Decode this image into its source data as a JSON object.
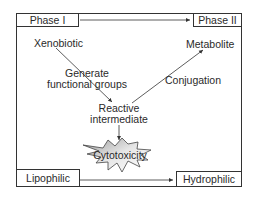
{
  "diagram": {
    "type": "metabolism-pathway",
    "corner_labels": {
      "top_left": "Phase I",
      "top_right": "Phase II",
      "bottom_left": "Lipophilic",
      "bottom_right": "Hydrophilic"
    },
    "nodes": {
      "xenobiotic": "Xenobiotic",
      "metabolite": "Metabolite",
      "reactive_line1": "Reactive",
      "reactive_line2": "intermediate",
      "cytotoxicity": "Cytotoxicity"
    },
    "edge_labels": {
      "generate_line1": "Generate",
      "generate_line2": "functional groups",
      "conjugation": "Conjugation"
    },
    "edges": [
      {
        "from": "Phase I",
        "to": "Phase II"
      },
      {
        "from": "Lipophilic",
        "to": "Hydrophilic"
      },
      {
        "from": "Xenobiotic",
        "to": "Reactive intermediate",
        "label": "Generate functional groups"
      },
      {
        "from": "Reactive intermediate",
        "to": "Metabolite",
        "label": "Conjugation"
      },
      {
        "from": "Reactive intermediate",
        "to": "Cytotoxicity"
      }
    ],
    "colors": {
      "line": "#333333",
      "star_fill": "#c8c8c8",
      "background": "#ffffff"
    }
  }
}
